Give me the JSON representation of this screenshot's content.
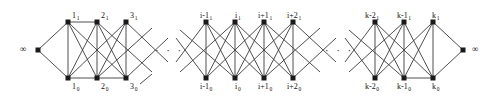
{
  "figure": {
    "name": "graph-chain-diagram",
    "background_color": "#ffffff",
    "edge_color": "#3a3a3a",
    "node_color": "#1a1a1a",
    "terminal_left": "∞",
    "terminal_right": "∞",
    "ellipsis_left": "· · ·",
    "ellipsis_right": "· · ·",
    "top_labels": [
      {
        "base": "1",
        "sub": "1",
        "x": 72,
        "y": 12
      },
      {
        "base": "2",
        "sub": "1",
        "x": 101,
        "y": 12
      },
      {
        "base": "3",
        "sub": "1",
        "x": 130,
        "y": 12
      },
      {
        "base": "i-1",
        "sub": "1",
        "x": 200,
        "y": 12
      },
      {
        "base": "i",
        "sub": "1",
        "x": 235,
        "y": 12
      },
      {
        "base": "i+1",
        "sub": "1",
        "x": 258,
        "y": 12
      },
      {
        "base": "i+2",
        "sub": "1",
        "x": 287,
        "y": 12
      },
      {
        "base": "k-2",
        "sub": "1",
        "x": 365,
        "y": 12
      },
      {
        "base": "k-1",
        "sub": "1",
        "x": 397,
        "y": 12
      },
      {
        "base": "k",
        "sub": "1",
        "x": 432,
        "y": 12
      }
    ],
    "bottom_labels": [
      {
        "base": "1",
        "sub": "0",
        "x": 72,
        "y": 83
      },
      {
        "base": "2",
        "sub": "0",
        "x": 101,
        "y": 83
      },
      {
        "base": "3",
        "sub": "0",
        "x": 130,
        "y": 83
      },
      {
        "base": "i-1",
        "sub": "0",
        "x": 200,
        "y": 83
      },
      {
        "base": "i",
        "sub": "0",
        "x": 235,
        "y": 83
      },
      {
        "base": "i+1",
        "sub": "0",
        "x": 258,
        "y": 83
      },
      {
        "base": "i+2",
        "sub": "0",
        "x": 287,
        "y": 83
      },
      {
        "base": "k-2",
        "sub": "0",
        "x": 365,
        "y": 83
      },
      {
        "base": "k-1",
        "sub": "0",
        "x": 397,
        "y": 83
      },
      {
        "base": "k",
        "sub": "0",
        "x": 432,
        "y": 83
      }
    ],
    "node_columns": [
      {
        "id": "c1",
        "x": 68
      },
      {
        "id": "c2",
        "x": 97
      },
      {
        "id": "c3",
        "x": 126
      },
      {
        "id": "ci-1",
        "x": 206
      },
      {
        "id": "ci",
        "x": 235
      },
      {
        "id": "ci+1",
        "x": 264
      },
      {
        "id": "ci+2",
        "x": 293
      },
      {
        "id": "ck-2",
        "x": 375
      },
      {
        "id": "ck-1",
        "x": 404
      },
      {
        "id": "ck",
        "x": 433
      }
    ],
    "rows": {
      "top_y": 22,
      "bottom_y": 78
    },
    "terminals": {
      "left": {
        "x": 38,
        "y": 50,
        "label_x": 20,
        "label_y": 45
      },
      "right": {
        "x": 463,
        "y": 50,
        "label_x": 472,
        "label_y": 45
      }
    },
    "ellipsis_positions": [
      {
        "x": 155,
        "y": 45
      },
      {
        "x": 325,
        "y": 45
      }
    ]
  }
}
